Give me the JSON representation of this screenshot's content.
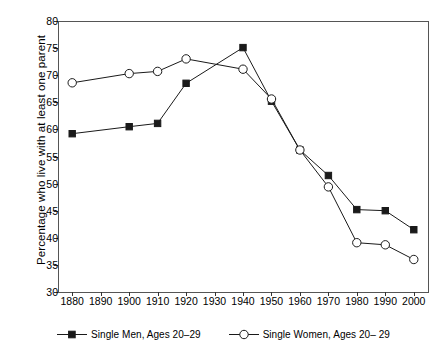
{
  "chart_data": {
    "type": "line",
    "title": "",
    "xlabel": "",
    "ylabel": "Percentage who live with at least one parent",
    "x": [
      1880,
      1890,
      1900,
      1910,
      1920,
      1930,
      1940,
      1950,
      1960,
      1970,
      1980,
      1990,
      2000
    ],
    "xticklabels": [
      "1880",
      "1890",
      "1900",
      "1910",
      "1920",
      "1930",
      "1940",
      "1950",
      "1960",
      "1970",
      "1980",
      "1990",
      "2000"
    ],
    "xlim": [
      1875,
      2005
    ],
    "ylim": [
      30,
      80
    ],
    "yticks": [
      30,
      35,
      40,
      45,
      50,
      55,
      60,
      65,
      70,
      75,
      80
    ],
    "yticklabels": [
      "30",
      "35",
      "40",
      "45",
      "50",
      "55",
      "60",
      "65",
      "70",
      "75",
      "80"
    ],
    "grid": false,
    "legend_position": "bottom",
    "series": [
      {
        "name": "Single Men, Ages 20–29",
        "marker": "filled-square",
        "color": "#1a1a1a",
        "x": [
          1880,
          1900,
          1910,
          1920,
          1940,
          1950,
          1960,
          1970,
          1980,
          1990,
          2000
        ],
        "values": [
          59.2,
          60.5,
          61.1,
          68.5,
          75.1,
          65.2,
          56.2,
          51.5,
          45.2,
          45.0,
          41.5
        ]
      },
      {
        "name": "Single Women, Ages 20– 29",
        "marker": "open-circle",
        "color": "#1a1a1a",
        "x": [
          1880,
          1900,
          1910,
          1920,
          1940,
          1950,
          1960,
          1970,
          1980,
          1990,
          2000
        ],
        "values": [
          68.6,
          70.3,
          70.7,
          73.0,
          71.1,
          65.6,
          56.2,
          49.4,
          39.1,
          38.7,
          36.0
        ]
      }
    ]
  },
  "legend": {
    "items": [
      {
        "label": "Single Men, Ages 20–29",
        "marker": "filled-square"
      },
      {
        "label": "Single Women, Ages 20– 29",
        "marker": "open-circle"
      }
    ]
  },
  "axes": {
    "y_title": "Percentage who live with at least one parent"
  }
}
